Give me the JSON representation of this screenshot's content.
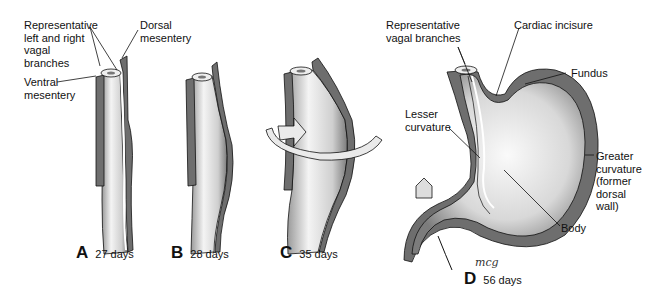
{
  "figure": {
    "stages": [
      {
        "letter": "A",
        "days": "27 days"
      },
      {
        "letter": "B",
        "days": "28 days"
      },
      {
        "letter": "C",
        "days": "35 days"
      },
      {
        "letter": "D",
        "days": "56 days"
      }
    ],
    "labels": {
      "vagal_a": "Representative\nleft and right\nvagal\nbranches",
      "dorsal_mesentery": "Dorsal\nmesentery",
      "ventral_mesentery": "Ventral\nmesentery",
      "vagal_d": "Representative\nvagal branches",
      "cardiac_incisure": "Cardiac incisure",
      "fundus": "Fundus",
      "lesser_curvature": "Lesser\ncurvature",
      "greater_curvature": "Greater\ncurvature\n(former\ndorsal wall)",
      "body": "Body"
    },
    "signature": "mcg",
    "colors": {
      "wall": "#6e6e6e",
      "lumen_light": "#f2f2f2",
      "lumen_dark": "#8a8a8a",
      "line": "#111111"
    }
  }
}
